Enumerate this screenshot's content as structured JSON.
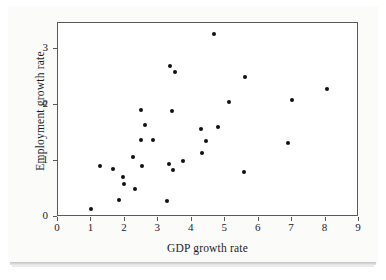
{
  "chart_data": {
    "type": "scatter",
    "title": "",
    "xlabel": "GDP growth rate",
    "ylabel": "Employment growth rate",
    "xlim": [
      0,
      9
    ],
    "ylim": [
      0,
      3.47
    ],
    "xticks": [
      0,
      1,
      2,
      3,
      4,
      5,
      6,
      7,
      8,
      9
    ],
    "yticks": [
      0,
      1,
      2,
      3
    ],
    "xtick_labels": [
      "0",
      "1",
      "2",
      "3",
      "4",
      "5",
      "6",
      "7",
      "8",
      "9"
    ],
    "ytick_labels": [
      "0",
      "1",
      "2",
      "3"
    ],
    "grid": false,
    "legend": false,
    "marker": "filled-circle",
    "marker_color": "#111114",
    "frame_color": "#59595c",
    "background": "#ffffff",
    "points": [
      {
        "x": 1.03,
        "y": 0.12
      },
      {
        "x": 1.3,
        "y": 0.89
      },
      {
        "x": 1.68,
        "y": 0.84
      },
      {
        "x": 1.86,
        "y": 0.29
      },
      {
        "x": 1.97,
        "y": 0.69
      },
      {
        "x": 2.0,
        "y": 0.57
      },
      {
        "x": 2.26,
        "y": 1.06
      },
      {
        "x": 2.34,
        "y": 0.49
      },
      {
        "x": 2.5,
        "y": 1.36
      },
      {
        "x": 2.52,
        "y": 1.9
      },
      {
        "x": 2.55,
        "y": 0.9
      },
      {
        "x": 2.63,
        "y": 1.63
      },
      {
        "x": 2.88,
        "y": 1.36
      },
      {
        "x": 3.3,
        "y": 0.27
      },
      {
        "x": 3.35,
        "y": 0.93
      },
      {
        "x": 3.38,
        "y": 2.68
      },
      {
        "x": 3.45,
        "y": 1.88
      },
      {
        "x": 3.48,
        "y": 0.82
      },
      {
        "x": 3.52,
        "y": 2.58
      },
      {
        "x": 3.77,
        "y": 0.98
      },
      {
        "x": 4.3,
        "y": 1.55
      },
      {
        "x": 4.33,
        "y": 1.12
      },
      {
        "x": 4.45,
        "y": 1.34
      },
      {
        "x": 4.7,
        "y": 3.25
      },
      {
        "x": 4.8,
        "y": 1.6
      },
      {
        "x": 5.15,
        "y": 2.04
      },
      {
        "x": 5.6,
        "y": 0.79
      },
      {
        "x": 5.62,
        "y": 2.48
      },
      {
        "x": 6.92,
        "y": 1.3
      },
      {
        "x": 7.03,
        "y": 2.07
      },
      {
        "x": 8.08,
        "y": 2.27
      }
    ]
  }
}
